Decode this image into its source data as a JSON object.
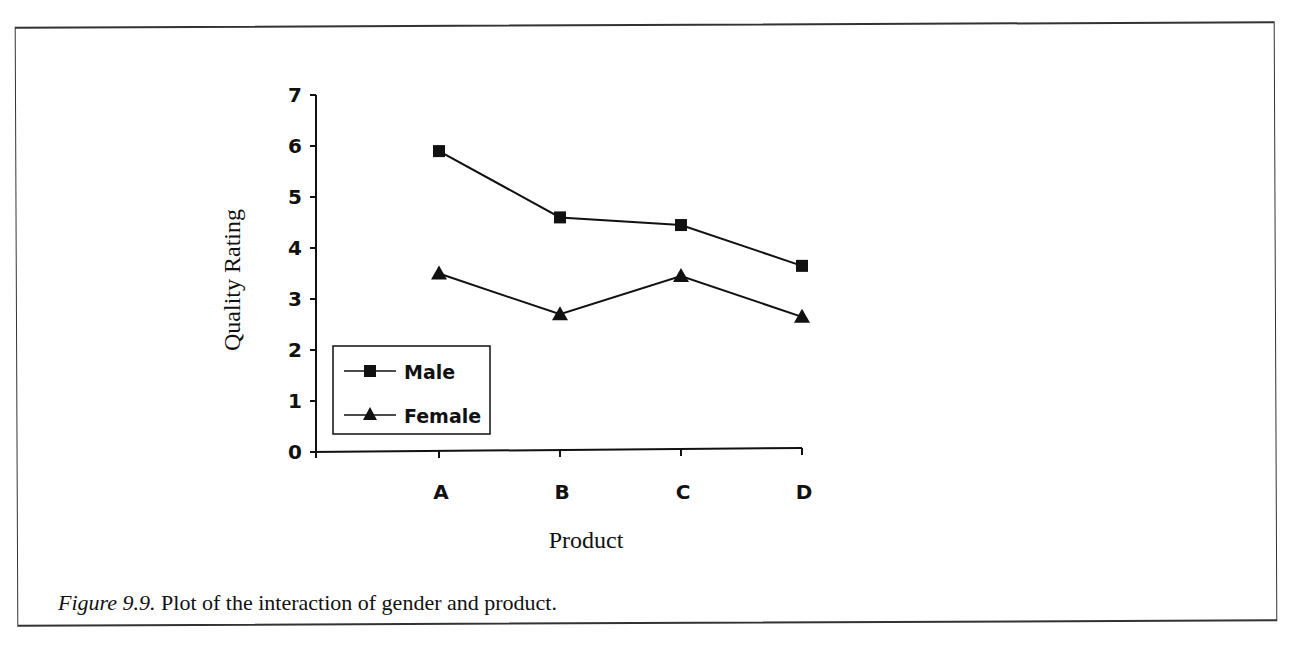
{
  "figure": {
    "caption_label": "Figure 9.9.",
    "caption_text": " Plot of the interaction of gender and product."
  },
  "chart_data": {
    "type": "line",
    "title": "",
    "xlabel": "Product",
    "ylabel": "Quality Rating",
    "categories": [
      "A",
      "B",
      "C",
      "D"
    ],
    "series": [
      {
        "name": "Male",
        "marker": "square",
        "values": [
          5.9,
          4.6,
          4.45,
          3.65
        ]
      },
      {
        "name": "Female",
        "marker": "triangle",
        "values": [
          3.5,
          2.7,
          3.45,
          2.65
        ]
      }
    ],
    "ylim": [
      0,
      7
    ],
    "yticks": [
      0,
      1,
      2,
      3,
      4,
      5,
      6,
      7
    ],
    "grid": false,
    "legend_position": "inside lower left",
    "colors": {
      "line": "#111111",
      "marker": "#111111"
    }
  }
}
